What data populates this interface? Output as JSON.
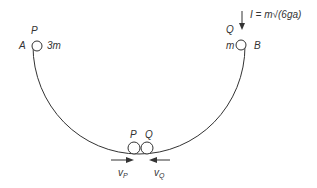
{
  "diagram": {
    "labels": {
      "point_a": "A",
      "point_b": "B",
      "particle_p_top": "P",
      "particle_q_top": "Q",
      "mass_p": "3m",
      "mass_q": "m",
      "impulse": "I = m√(6ga)",
      "particle_p_bottom": "P",
      "particle_q_bottom": "Q",
      "velocity_p": "v",
      "velocity_p_sub": "P",
      "velocity_q": "v",
      "velocity_q_sub": "Q"
    },
    "colors": {
      "stroke": "#333333",
      "background": "#ffffff"
    }
  }
}
